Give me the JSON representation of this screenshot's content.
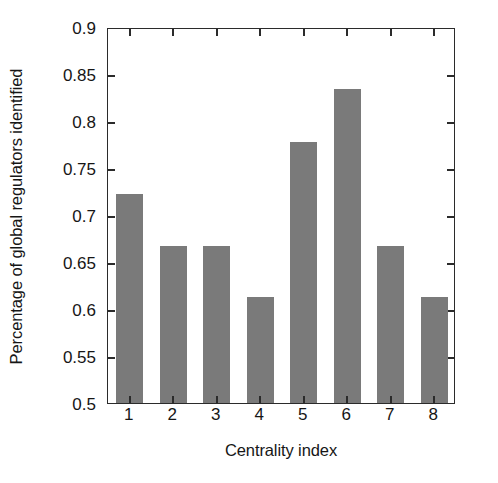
{
  "chart_data": {
    "type": "bar",
    "title": "",
    "xlabel": "Centrality index",
    "ylabel": "Percentage of global regulators identified",
    "categories": [
      "1",
      "2",
      "3",
      "4",
      "5",
      "6",
      "7",
      "8"
    ],
    "values": [
      0.722,
      0.667,
      0.667,
      0.613,
      0.778,
      0.834,
      0.667,
      0.613
    ],
    "ylim": [
      0.5,
      0.9
    ],
    "yticks": [
      0.5,
      0.55,
      0.6,
      0.65,
      0.7,
      0.75,
      0.8,
      0.85,
      0.9
    ],
    "ytick_labels": [
      "0.5",
      "0.55",
      "0.6",
      "0.65",
      "0.7",
      "0.75",
      "0.8",
      "0.85",
      "0.9"
    ],
    "xtick_labels": [
      "1",
      "2",
      "3",
      "4",
      "5",
      "6",
      "7",
      "8"
    ],
    "grid": false,
    "legend": null,
    "bar_color": "#7a7a7a",
    "axis_color": "#2b2b2b",
    "background": "#ffffff"
  }
}
